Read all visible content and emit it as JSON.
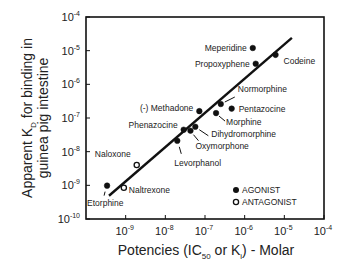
{
  "chart_data": {
    "type": "scatter",
    "title": "",
    "xlabel": "Potencies (IC50 or Ki) - Molar",
    "xlabel_parts": {
      "pre": "Potencies (IC",
      "sub1": "50",
      "mid": " or K",
      "sub2": "i",
      "post": ") - Molar"
    },
    "ylabel": "Apparent KD for binding in guinea pig intestine",
    "ylabel_parts": {
      "line1_pre": "Apparent K",
      "line1_sub": "D",
      "line1_post": " for binding in",
      "line2": "guinea pig intestine"
    },
    "xscale": "log",
    "yscale": "log",
    "xlim": [
      1e-10,
      0.0001
    ],
    "ylim": [
      1e-10,
      0.0001
    ],
    "x_ticks": [
      {
        "base": "10",
        "exp": "-9",
        "value": 1e-09
      },
      {
        "base": "10",
        "exp": "-8",
        "value": 1e-08
      },
      {
        "base": "10",
        "exp": "-7",
        "value": 1e-07
      },
      {
        "base": "10",
        "exp": "-6",
        "value": 1e-06
      },
      {
        "base": "10",
        "exp": "-5",
        "value": 1e-05
      },
      {
        "base": "10",
        "exp": "-4",
        "value": 0.0001
      }
    ],
    "y_ticks": [
      {
        "base": "10",
        "exp": "-4",
        "value": 0.0001
      },
      {
        "base": "10",
        "exp": "-5",
        "value": 1e-05
      },
      {
        "base": "10",
        "exp": "-6",
        "value": 1e-06
      },
      {
        "base": "10",
        "exp": "-7",
        "value": 1e-07
      },
      {
        "base": "10",
        "exp": "-8",
        "value": 1e-08
      },
      {
        "base": "10",
        "exp": "-9",
        "value": 1e-09
      },
      {
        "base": "10",
        "exp": "-10",
        "value": 1e-10
      }
    ],
    "grid": false,
    "legend": {
      "position": "lower right",
      "entries": [
        {
          "label": "AGONIST",
          "marker": "filled-circle"
        },
        {
          "label": "ANTAGONIST",
          "marker": "open-circle"
        }
      ]
    },
    "series": [
      {
        "name": "AGONIST",
        "marker": "filled-circle",
        "points": [
          {
            "label": "Etorphine",
            "x": 3.4e-10,
            "y": 9.8e-10
          },
          {
            "label": "Levorphanol",
            "x": 2e-08,
            "y": 2.1e-08
          },
          {
            "label": "Phenazocine",
            "x": 2.9e-08,
            "y": 4.5e-08
          },
          {
            "label": "Oxymorphone",
            "x": 4.3e-08,
            "y": 4.2e-08
          },
          {
            "label": "Dihydromorphine",
            "x": 5.7e-08,
            "y": 5.5e-08
          },
          {
            "label": "(-) Methadone",
            "x": 7.2e-08,
            "y": 1.6e-07
          },
          {
            "label": "Morphine",
            "x": 1.9e-07,
            "y": 1.4e-07
          },
          {
            "label": "Normorphine",
            "x": 2.5e-07,
            "y": 2.6e-07
          },
          {
            "label": "Pentazocine",
            "x": 4.7e-07,
            "y": 1.9e-07
          },
          {
            "label": "Meperidine",
            "x": 1.6e-06,
            "y": 1.2e-05
          },
          {
            "label": "Propoxyphene",
            "x": 1.9e-06,
            "y": 4.1e-06
          },
          {
            "label": "Codeine",
            "x": 6e-06,
            "y": 7.5e-06
          }
        ]
      },
      {
        "name": "ANTAGONIST",
        "marker": "open-circle",
        "points": [
          {
            "label": "Naltrexone",
            "x": 9e-10,
            "y": 8.5e-10
          },
          {
            "label": "Naloxone",
            "x": 1.9e-09,
            "y": 4e-09
          }
        ]
      }
    ],
    "fit_line": {
      "x": [
        3.8e-10,
        1.55e-05
      ],
      "y": [
        4.9e-10,
        2.4e-05
      ]
    }
  }
}
